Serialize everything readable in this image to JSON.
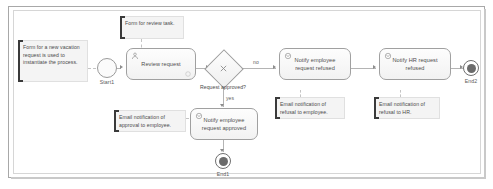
{
  "diagram": {
    "type": "bpmn-process-flow",
    "colors": {
      "frame_border": "#a8a8a8",
      "node_border": "#a0a0a0",
      "node_fill": "#f6f6f6",
      "note_fill": "#f4f4f4",
      "note_bar": "#3a3a3a",
      "connector": "#b4b4b4",
      "text": "#4b4b4b"
    }
  },
  "events": {
    "start": {
      "label": "Start1",
      "icon": "start-event-icon"
    },
    "end_approved": {
      "label": "End1",
      "icon": "end-event-icon"
    },
    "end_refused": {
      "label": "End2",
      "icon": "end-event-icon"
    }
  },
  "tasks": [
    {
      "id": "review",
      "label": "Review request",
      "icon": "user-task-icon"
    },
    {
      "id": "notify_employee_refused",
      "label": "Notify employee request refused",
      "icon": "message-task-icon"
    },
    {
      "id": "notify_hr_refused",
      "label": "Notify HR request refused",
      "icon": "message-task-icon"
    },
    {
      "id": "notify_employee_approved",
      "label": "Notify employee request approved",
      "icon": "message-task-icon"
    }
  ],
  "gateway": {
    "label": "Request approved?",
    "type": "exclusive",
    "icon": "exclusive-gateway-icon",
    "branch_no": "no",
    "branch_yes": "yes"
  },
  "notes": [
    {
      "id": "note_start",
      "text": "Form for a new vacation request is used to instantiate the process."
    },
    {
      "id": "note_review",
      "text": "Form for review task."
    },
    {
      "id": "note_approval_email",
      "text": "Email notification of approval to employee."
    },
    {
      "id": "note_refusal_employee",
      "text": "Email notification of refusal to employee."
    },
    {
      "id": "note_refusal_hr",
      "text": "Email notification of refusal to HR."
    }
  ]
}
